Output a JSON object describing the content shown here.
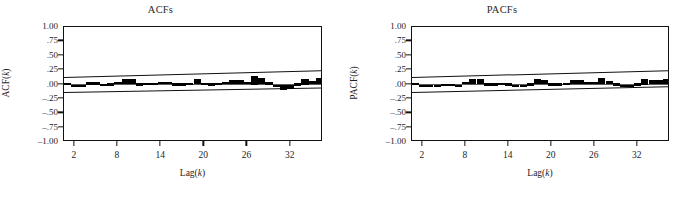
{
  "figure": {
    "background": "#ffffff",
    "bar_color": "#000000",
    "axis_color": "#111111",
    "zero_line_color": "#5a5a5a"
  },
  "panels": [
    {
      "id": "acf",
      "title": "ACFs",
      "y_axis_label": "ACF(k)",
      "x_axis_label": "Lag(k)"
    },
    {
      "id": "pacf",
      "title": "PACFs",
      "y_axis_label": "PACF(k)",
      "x_axis_label": "Lag(k)"
    }
  ],
  "axis": {
    "y_ticks": [
      "1.00",
      ".75",
      ".50",
      ".25",
      ".00",
      "-.25",
      "-.50",
      "-.75",
      "-1.00"
    ],
    "y_values": [
      1.0,
      0.75,
      0.5,
      0.25,
      0.0,
      -0.25,
      -0.5,
      -0.75,
      -1.0
    ],
    "x_ticks": [
      "2",
      "8",
      "14",
      "20",
      "26",
      "32"
    ],
    "x_values": [
      2,
      8,
      14,
      20,
      26,
      32
    ]
  },
  "chart_data": [
    {
      "type": "bar",
      "id": "acf",
      "title": "ACFs",
      "xlabel": "Lag(k)",
      "ylabel": "ACF(k)",
      "ylim": [
        -1.0,
        1.0
      ],
      "xlim": [
        0.5,
        36.5
      ],
      "grid": false,
      "legend": null,
      "zero_line": 0.0,
      "confidence_band": {
        "label": "approximate 95% confidence limits",
        "upper_start": 0.13,
        "upper_end": 0.25,
        "lower_start": -0.13,
        "lower_end": -0.05,
        "style": "solid-slanted"
      },
      "x": [
        1,
        2,
        3,
        4,
        5,
        6,
        7,
        8,
        9,
        10,
        11,
        12,
        13,
        14,
        15,
        16,
        17,
        18,
        19,
        20,
        21,
        22,
        23,
        24,
        25,
        26,
        27,
        28,
        29,
        30,
        31,
        32,
        33,
        34,
        35,
        36
      ],
      "values": [
        0.03,
        -0.03,
        -0.02,
        0.05,
        0.05,
        0.01,
        0.02,
        0.04,
        0.09,
        0.09,
        0.02,
        0.03,
        0.03,
        0.04,
        0.04,
        0.02,
        0.02,
        0.03,
        0.09,
        0.03,
        0.02,
        0.03,
        0.04,
        0.07,
        0.07,
        0.04,
        0.15,
        0.12,
        0.05,
        -0.02,
        -0.09,
        -0.08,
        0.02,
        0.1,
        0.06,
        0.11
      ]
    },
    {
      "type": "bar",
      "id": "pacf",
      "title": "PACFs",
      "xlabel": "Lag(k)",
      "ylabel": "PACF(k)",
      "ylim": [
        -1.0,
        1.0
      ],
      "xlim": [
        0.5,
        36.5
      ],
      "grid": false,
      "legend": null,
      "zero_line": 0.0,
      "confidence_band": {
        "label": "approximate 95% confidence limits",
        "upper_start": 0.13,
        "upper_end": 0.25,
        "lower_start": -0.13,
        "lower_end": -0.03,
        "style": "solid-slanted"
      },
      "x": [
        1,
        2,
        3,
        4,
        5,
        6,
        7,
        8,
        9,
        10,
        11,
        12,
        13,
        14,
        15,
        16,
        17,
        18,
        19,
        20,
        21,
        22,
        23,
        24,
        25,
        26,
        27,
        28,
        29,
        30,
        31,
        32,
        33,
        34,
        35,
        36
      ],
      "values": [
        0.03,
        -0.04,
        -0.05,
        -0.03,
        0.01,
        0.01,
        -0.02,
        0.04,
        0.09,
        0.09,
        0.02,
        0.02,
        0.03,
        0.02,
        0.0,
        -0.02,
        0.02,
        0.09,
        0.07,
        0.02,
        0.02,
        0.03,
        0.08,
        0.08,
        0.04,
        0.04,
        0.11,
        0.06,
        0.02,
        -0.03,
        -0.02,
        0.02,
        0.1,
        0.07,
        0.07,
        0.09
      ]
    }
  ]
}
